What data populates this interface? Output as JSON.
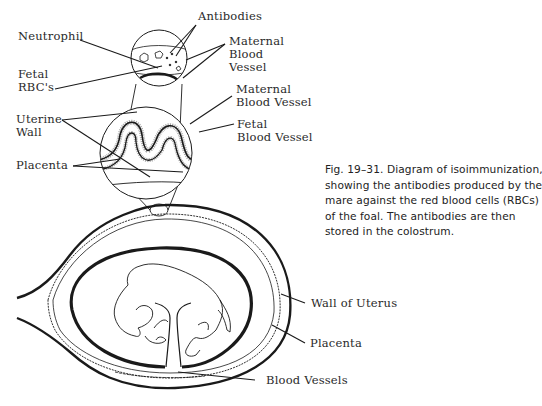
{
  "figure": {
    "caption_lines": [
      "Fig. 19–31. Diagram of isoimmunization,",
      "showing the antibodies produced by the",
      "mare against the red blood cells (RBCs)",
      "of the foal. The antibodies are then",
      "stored in the colostrum."
    ],
    "labels": {
      "antibodies": "Antibodies",
      "neutrophil": "Neutrophil",
      "fetal_rbcs_line1": "Fetal",
      "fetal_rbcs_line2": "RBC's",
      "maternal_blood_vessel_top_line1": "Maternal",
      "maternal_blood_vessel_top_line2": "Blood",
      "maternal_blood_vessel_top_line3": "Vessel",
      "maternal_blood_vessel_mid_line1": "Maternal",
      "maternal_blood_vessel_mid_line2": "Blood Vessel",
      "fetal_blood_vessel_line1": "Fetal",
      "fetal_blood_vessel_line2": "Blood Vessel",
      "uterine_wall_line1": "Uterine",
      "uterine_wall_line2": "Wall",
      "placenta_upper": "Placenta",
      "wall_of_uterus": "Wall of Uterus",
      "placenta_lower": "Placenta",
      "blood_vessels": "Blood Vessels"
    },
    "colors": {
      "ink": "#1a1a1a",
      "background": "#ffffff"
    }
  }
}
